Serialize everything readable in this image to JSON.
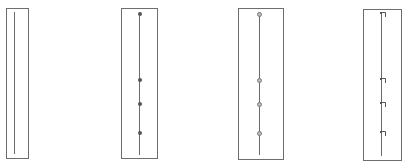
{
  "figure": {
    "panels": [
      {
        "id": "panel-1",
        "box": {
          "left": 6,
          "top": 8,
          "width": 23,
          "height": 151
        },
        "line": {
          "x": 14,
          "top": 12,
          "bottom": 154
        },
        "marker_style": "none",
        "markers": []
      },
      {
        "id": "panel-2",
        "box": {
          "left": 121,
          "top": 8,
          "width": 37,
          "height": 151
        },
        "line": {
          "x": 139,
          "top": 12,
          "bottom": 155
        },
        "marker_style": "dot",
        "markers": [
          14,
          80,
          104,
          133
        ]
      },
      {
        "id": "panel-3",
        "box": {
          "left": 238,
          "top": 8,
          "width": 46,
          "height": 152
        },
        "line": {
          "x": 259,
          "top": 12,
          "bottom": 155
        },
        "marker_style": "ring",
        "markers": [
          14,
          80,
          104,
          133
        ]
      },
      {
        "id": "panel-4",
        "box": {
          "left": 363,
          "top": 9,
          "width": 39,
          "height": 152
        },
        "line": {
          "x": 381,
          "top": 13,
          "bottom": 156
        },
        "marker_style": "flag",
        "markers": [
          14,
          80,
          104,
          133
        ]
      }
    ],
    "colors": {
      "border": "#6e6e6e",
      "line": "#6a6a6a",
      "marker": "#555555",
      "background": "#ffffff"
    }
  }
}
